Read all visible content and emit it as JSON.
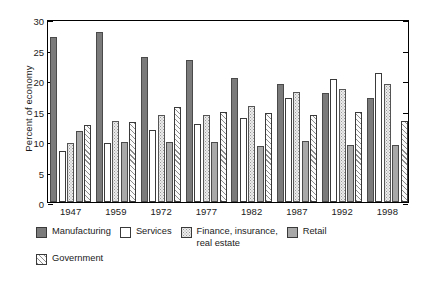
{
  "chart_data": {
    "type": "bar",
    "title": "",
    "xlabel": "",
    "ylabel": "Percent of economy",
    "ylim": [
      0,
      30
    ],
    "yticks": [
      0,
      5,
      10,
      15,
      20,
      25,
      30
    ],
    "ytick_labels": [
      "0",
      "5",
      "10",
      "15",
      "20",
      "25",
      "30"
    ],
    "grid": false,
    "legend_position": "below-plot",
    "categories": [
      "1947",
      "1959",
      "1972",
      "1977",
      "1982",
      "1987",
      "1992",
      "1998"
    ],
    "series": [
      {
        "name": "Manufacturing",
        "key": "manufacturing",
        "color": "#7b7b7b",
        "pattern": "solid-dark-gray",
        "values": [
          27.0,
          27.9,
          23.8,
          23.2,
          20.4,
          19.4,
          17.8,
          17.0
        ]
      },
      {
        "name": "Services",
        "key": "services",
        "color": "#ffffff",
        "pattern": "white",
        "values": [
          8.4,
          9.7,
          11.8,
          12.8,
          13.8,
          17.0,
          20.2,
          21.2
        ]
      },
      {
        "name": "Finance, insurance,\nreal estate",
        "key": "fire",
        "color": "#ececec",
        "pattern": "dotted",
        "values": [
          9.7,
          13.2,
          14.2,
          14.3,
          15.8,
          18.0,
          18.5,
          19.4
        ]
      },
      {
        "name": "Retail",
        "key": "retail",
        "color": "#a8a8a8",
        "pattern": "solid-mid-gray",
        "values": [
          11.6,
          9.9,
          9.9,
          9.8,
          9.2,
          10.0,
          9.3,
          9.4
        ]
      },
      {
        "name": "Government",
        "key": "government",
        "color": "#fbfbfb",
        "pattern": "diagonal-hatch",
        "values": [
          12.7,
          13.1,
          15.6,
          14.7,
          14.6,
          14.3,
          14.8,
          13.2
        ]
      }
    ]
  },
  "legend": {
    "rows": [
      [
        {
          "label": "Manufacturing",
          "key": "manufacturing"
        },
        {
          "label": "Services",
          "key": "services"
        },
        {
          "label": "Finance, insurance,\nreal estate",
          "key": "fire"
        },
        {
          "label": "Retail",
          "key": "retail"
        }
      ],
      [
        {
          "label": "Government",
          "key": "government"
        }
      ]
    ]
  }
}
